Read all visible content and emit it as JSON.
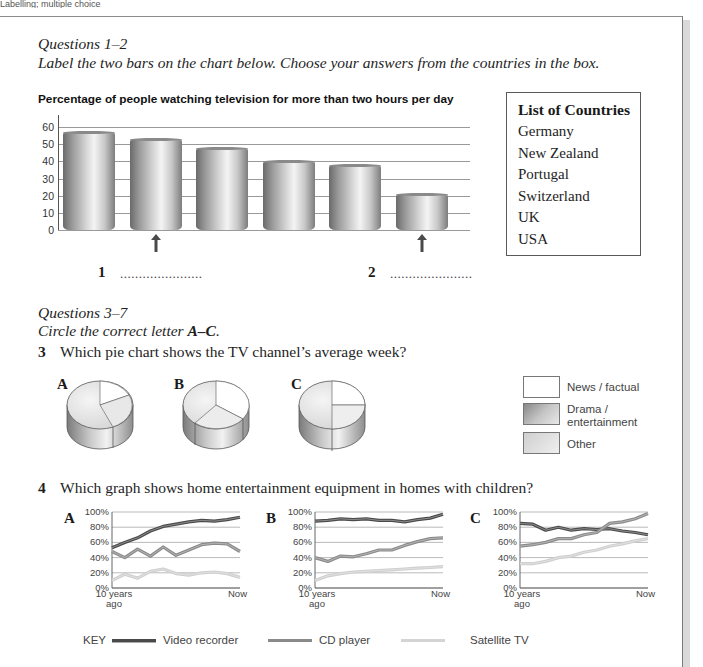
{
  "page": {
    "header": "Labelling; multiple choice"
  },
  "section1": {
    "heading": "Questions 1–2",
    "instruction": "Label the two bars on the chart below. Choose your answers from the countries in the box.",
    "answers": [
      {
        "number": "1",
        "blank": "......................"
      },
      {
        "number": "2",
        "blank": "......................"
      }
    ]
  },
  "country_box": {
    "title": "List of Countries",
    "items": [
      "Germany",
      "New Zealand",
      "Portugal",
      "Switzerland",
      "UK",
      "USA"
    ]
  },
  "section2": {
    "heading": "Questions 3–7",
    "instruction_prefix": "Circle the correct letter ",
    "instruction_bold": "A–C",
    "instruction_suffix": "."
  },
  "question3": {
    "number": "3",
    "text": "Which pie chart shows the TV channel’s average week?",
    "options": [
      "A",
      "B",
      "C"
    ],
    "legend": [
      {
        "label": "News / factual",
        "color": "#ffffff"
      },
      {
        "label": "Drama / entertainment",
        "label_line1": "Drama /",
        "label_line2": "entertainment",
        "color": "#a8a8a8"
      },
      {
        "label": "Other",
        "color": "#e2e2e2"
      }
    ]
  },
  "question4": {
    "number": "4",
    "text": "Which graph shows home entertainment equipment in homes with children?",
    "options": [
      "A",
      "B",
      "C"
    ],
    "y_ticks": [
      "100%",
      "80%",
      "60%",
      "40%",
      "20%",
      "0%"
    ],
    "x_start_line1": "10 years",
    "x_start_line2": "ago",
    "x_end": "Now",
    "key": {
      "label": "KEY",
      "items": [
        {
          "label": "Video recorder",
          "color": "#4a4a4a"
        },
        {
          "label": "CD player",
          "color": "#8a8a8a"
        },
        {
          "label": "Satellite TV",
          "color": "#cfcfcf"
        }
      ]
    }
  },
  "chart_data": [
    {
      "type": "bar",
      "title": "Percentage of people watching television for more than two hours per day",
      "categories": [
        "",
        "1",
        "",
        "",
        "",
        "2"
      ],
      "values": [
        57,
        53,
        48,
        40,
        38,
        21
      ],
      "xlabel": "",
      "ylabel": "",
      "ylim": [
        0,
        60
      ],
      "yticks": [
        0,
        10,
        20,
        30,
        40,
        50,
        60
      ],
      "grid": true,
      "annotations": [
        "arrow under bar 2 labelled 1",
        "arrow under bar 6 labelled 2"
      ]
    },
    {
      "type": "pie",
      "title": "A",
      "categories": [
        "News / factual",
        "Drama / entertainment",
        "Other"
      ],
      "values": [
        22,
        45,
        33
      ]
    },
    {
      "type": "pie",
      "title": "B",
      "categories": [
        "News / factual",
        "Drama / entertainment",
        "Other"
      ],
      "values": [
        33,
        33,
        34
      ]
    },
    {
      "type": "pie",
      "title": "C",
      "categories": [
        "News / factual",
        "Drama / entertainment",
        "Other"
      ],
      "values": [
        25,
        50,
        25
      ]
    },
    {
      "type": "line",
      "title": "A",
      "x": [
        "10 years ago",
        "",
        "",
        "",
        "",
        "",
        "",
        "",
        "",
        "",
        "Now"
      ],
      "ylim": [
        0,
        100
      ],
      "yticks": [
        "0%",
        "20%",
        "40%",
        "60%",
        "80%",
        "100%"
      ],
      "grid": true,
      "series": [
        {
          "name": "Video recorder",
          "values": [
            53,
            60,
            66,
            75,
            81,
            84,
            87,
            89,
            88,
            90,
            93
          ]
        },
        {
          "name": "CD player",
          "values": [
            48,
            40,
            51,
            42,
            54,
            43,
            50,
            57,
            59,
            58,
            48
          ]
        },
        {
          "name": "Satellite TV",
          "values": [
            10,
            18,
            13,
            22,
            25,
            19,
            17,
            20,
            21,
            19,
            14
          ]
        }
      ]
    },
    {
      "type": "line",
      "title": "B",
      "x": [
        "10 years ago",
        "",
        "",
        "",
        "",
        "",
        "",
        "",
        "",
        "",
        "Now"
      ],
      "ylim": [
        0,
        100
      ],
      "yticks": [
        "0%",
        "20%",
        "40%",
        "60%",
        "80%",
        "100%"
      ],
      "grid": true,
      "series": [
        {
          "name": "Video recorder",
          "values": [
            88,
            89,
            91,
            90,
            91,
            89,
            89,
            87,
            90,
            92,
            97
          ]
        },
        {
          "name": "CD player",
          "values": [
            40,
            35,
            42,
            41,
            45,
            50,
            50,
            56,
            61,
            65,
            66
          ]
        },
        {
          "name": "Satellite TV",
          "values": [
            10,
            16,
            19,
            21,
            22,
            23,
            24,
            25,
            26,
            27,
            28
          ]
        }
      ]
    },
    {
      "type": "line",
      "title": "C",
      "x": [
        "10 years ago",
        "",
        "",
        "",
        "",
        "",
        "",
        "",
        "",
        "",
        "Now"
      ],
      "ylim": [
        0,
        100
      ],
      "yticks": [
        "0%",
        "20%",
        "40%",
        "60%",
        "80%",
        "100%"
      ],
      "grid": true,
      "series": [
        {
          "name": "Video recorder",
          "values": [
            85,
            84,
            76,
            80,
            76,
            78,
            77,
            78,
            75,
            73,
            70
          ]
        },
        {
          "name": "CD player",
          "values": [
            55,
            57,
            60,
            65,
            65,
            70,
            73,
            85,
            87,
            91,
            98
          ]
        },
        {
          "name": "Satellite TV",
          "values": [
            32,
            32,
            35,
            40,
            42,
            47,
            50,
            55,
            58,
            62,
            65
          ]
        }
      ]
    }
  ]
}
